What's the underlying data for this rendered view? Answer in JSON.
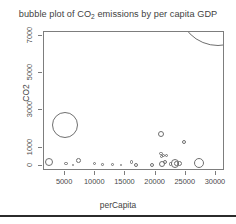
{
  "chart_data": {
    "type": "scatter",
    "title": "bubble plot of CO2 emissions by per capita GDP",
    "title_prefix": "bubble plot of CO",
    "title_sub": "2",
    "title_suffix": " emissions by per capita GDP",
    "xlabel": "perCapita",
    "ylabel": "CO2",
    "xlim": [
      1500,
      31500
    ],
    "ylim": [
      -250,
      7200
    ],
    "xticks": [
      5000,
      10000,
      15000,
      20000,
      25000,
      30000
    ],
    "xtick_labels": [
      "5000",
      "10000",
      "15000",
      "20000",
      "25000",
      "30000"
    ],
    "yticks": [
      0,
      1000,
      3000,
      5000,
      7000
    ],
    "ytick_labels": [
      "0",
      "1000",
      "3000",
      "5000",
      "7000"
    ],
    "grid": false,
    "legend": false,
    "marker": "open-circle",
    "size_encoding": "bubble area encodes population",
    "points": [
      {
        "x": 2300,
        "y": 230,
        "r": 4.2
      },
      {
        "x": 4950,
        "y": 2230,
        "r": 13.0
      },
      {
        "x": 5150,
        "y": 170,
        "r": 1.6
      },
      {
        "x": 6350,
        "y": 60,
        "r": 1.2
      },
      {
        "x": 7250,
        "y": 300,
        "r": 2.4
      },
      {
        "x": 9850,
        "y": 150,
        "r": 1.5
      },
      {
        "x": 11200,
        "y": 90,
        "r": 1.3
      },
      {
        "x": 12900,
        "y": 110,
        "r": 1.4
      },
      {
        "x": 14300,
        "y": 80,
        "r": 1.2
      },
      {
        "x": 16000,
        "y": 230,
        "r": 1.9
      },
      {
        "x": 16700,
        "y": 80,
        "r": 2.0
      },
      {
        "x": 19400,
        "y": 90,
        "r": 2.1
      },
      {
        "x": 20900,
        "y": 1720,
        "r": 3.2
      },
      {
        "x": 20850,
        "y": 680,
        "r": 1.8
      },
      {
        "x": 20900,
        "y": 530,
        "r": 1.5
      },
      {
        "x": 21350,
        "y": 560,
        "r": 1.6
      },
      {
        "x": 21750,
        "y": 560,
        "r": 1.6
      },
      {
        "x": 21050,
        "y": 130,
        "r": 3.2
      },
      {
        "x": 21550,
        "y": 230,
        "r": 2.2
      },
      {
        "x": 22500,
        "y": 120,
        "r": 1.7
      },
      {
        "x": 23200,
        "y": 150,
        "r": 4.1
      },
      {
        "x": 23450,
        "y": 140,
        "r": 2.3
      },
      {
        "x": 23900,
        "y": 130,
        "r": 2.6
      },
      {
        "x": 24700,
        "y": 1330,
        "r": 2.0
      },
      {
        "x": 27200,
        "y": 180,
        "r": 5.2
      },
      {
        "x": 30400,
        "y": 8600,
        "r": 40.0
      }
    ]
  },
  "colors": {
    "background": "#ffffff",
    "axis": "#7d7d7d",
    "text": "#3f3f3f",
    "marker": "#6f6f6f",
    "rule": "#2b2b2b"
  }
}
